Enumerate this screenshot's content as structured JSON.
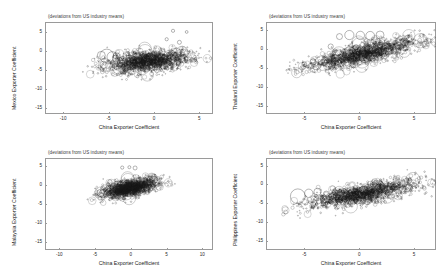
{
  "figure": {
    "type": "scatter-bubble-grid",
    "rows": 2,
    "cols": 2,
    "common_subtitle": "(deviations from US industry means)",
    "common_xlabel": "China Exporter Coefficient"
  },
  "chart_data": [
    {
      "id": "mexico",
      "type": "scatter",
      "title": "(deviations from US industry means)",
      "xlabel": "China Exporter Coefficient",
      "ylabel": "Mexico Exporter Coefficient",
      "xlim": [
        -12.0,
        6.5
      ],
      "ylim": [
        -16.5,
        7.5
      ],
      "xticks": [
        -10,
        -5,
        0,
        5
      ],
      "xticklabels": [
        "-10",
        "-5",
        "0",
        "5"
      ],
      "yticks": [
        5,
        0,
        -5,
        -10,
        -15
      ],
      "yticklabels": [
        "5",
        "0",
        "-5",
        "-10",
        "-15"
      ],
      "grid": false,
      "legend": "none",
      "marker": "open-circle-variable-size",
      "cloud": {
        "center_x": -0.6,
        "center_y": -2.9,
        "spread_x": 2.3,
        "spread_y": 1.35,
        "slope": 0.22,
        "n_points": 1500,
        "outlier_notes": "few isolated circles near y=5 at x=2..4; large open circles cluster near x=-5,y=-1.5"
      }
    },
    {
      "id": "thailand",
      "type": "scatter",
      "title": "(deviations from US industry means)",
      "xlabel": "China Exporter Coefficient",
      "ylabel": "Thailand Exporter Coefficient",
      "xlim": [
        -8.5,
        7.0
      ],
      "ylim": [
        -17.0,
        7.0
      ],
      "xticks": [
        -5,
        0,
        5
      ],
      "xticklabels": [
        "-5",
        "0",
        "5"
      ],
      "yticks": [
        5,
        0,
        -5,
        -10,
        -15
      ],
      "yticklabels": [
        "5",
        "0",
        "-5",
        "-10",
        "-15"
      ],
      "grid": false,
      "legend": "none",
      "marker": "open-circle-variable-size",
      "cloud": {
        "center_x": 0.4,
        "center_y": -1.3,
        "spread_x": 2.6,
        "spread_y": 1.25,
        "slope": 0.62,
        "n_points": 1500,
        "outlier_notes": "row of large open circles near y=3.5 spanning x=-1..2"
      }
    },
    {
      "id": "malaysia",
      "type": "scatter",
      "title": "(deviations from US industry means)",
      "xlabel": "China Exporter Coefficient",
      "ylabel": "Malaysia Exporter Coefficient",
      "xlim": [
        -12.0,
        11.5
      ],
      "ylim": [
        -17.0,
        7.0
      ],
      "xticks": [
        -10,
        -5,
        0,
        5,
        10
      ],
      "xticklabels": [
        "-10",
        "-5",
        "0",
        "5",
        "10"
      ],
      "yticks": [
        5,
        0,
        -5,
        -10,
        -15
      ],
      "yticklabels": [
        "5",
        "0",
        "-5",
        "-10",
        "-15"
      ],
      "grid": false,
      "legend": "none",
      "marker": "open-circle-variable-size",
      "cloud": {
        "center_x": -0.1,
        "center_y": -0.9,
        "spread_x": 1.9,
        "spread_y": 1.05,
        "slope": 0.35,
        "n_points": 1500,
        "outlier_notes": "sparse circles near y=4.5 around x=-1..1"
      }
    },
    {
      "id": "philippines",
      "type": "scatter",
      "title": "(deviations from US industry means)",
      "xlabel": "China Exporter Coefficient",
      "ylabel": "Philippines Exporter Coefficient",
      "xlim": [
        -8.5,
        7.0
      ],
      "ylim": [
        -17.5,
        7.0
      ],
      "xticks": [
        -5,
        0,
        5
      ],
      "xticklabels": [
        "-5",
        "0",
        "5"
      ],
      "yticks": [
        5,
        0,
        -5,
        -10,
        -15
      ],
      "yticklabels": [
        "5",
        "0",
        "-5",
        "-10",
        "-15"
      ],
      "grid": false,
      "legend": "none",
      "marker": "open-circle-variable-size",
      "cloud": {
        "center_x": 0.2,
        "center_y": -2.6,
        "spread_x": 2.5,
        "spread_y": 1.3,
        "slope": 0.52,
        "n_points": 1500,
        "outlier_notes": "very large open circle at about x=-5.6,y=-3.2; several large circles x=-5..-2"
      }
    }
  ]
}
